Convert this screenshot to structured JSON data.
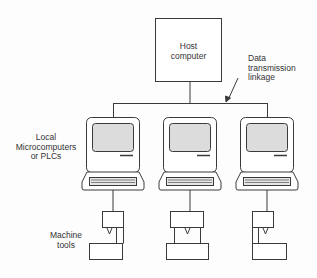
{
  "diagram": {
    "type": "network",
    "nodes": {
      "host": {
        "label_line1": "Host",
        "label_line2": "computer"
      },
      "link": {
        "label_line1": "Data",
        "label_line2": "transmission",
        "label_line3": "linkage"
      },
      "micro_group": {
        "label_line1": "Local",
        "label_line2": "Microcomputers",
        "label_line3": "or PLCs"
      },
      "tools_group": {
        "label_line1": "Machine",
        "label_line2": "tools"
      }
    },
    "computers": [
      {
        "id": "computer-1",
        "cx": 113
      },
      {
        "id": "computer-2",
        "cx": 190
      },
      {
        "id": "computer-3",
        "cx": 267
      }
    ],
    "edges": [
      "host -> bus",
      "bus -> computer-1",
      "bus -> computer-2",
      "bus -> computer-3",
      "computer-1 -> machine-tool-1",
      "computer-2 -> machine-tool-2",
      "computer-3 -> machine-tool-3"
    ],
    "colors": {
      "line": "#3a3a3a",
      "screen": "#dcdcdc",
      "background": "#fdfdfd"
    }
  }
}
